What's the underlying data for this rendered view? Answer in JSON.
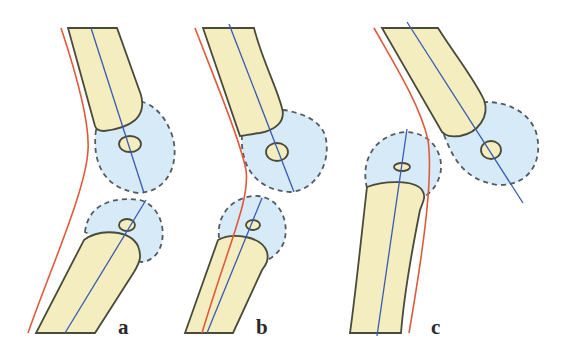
{
  "figure": {
    "colors": {
      "bone_fill": "#f3edc0",
      "bone_outline": "#4a4a3a",
      "capsule_fill": "#d6eaf7",
      "capsule_outline": "#555b60",
      "axis_line": "#3a5bb0",
      "contour_line": "#e05a3c",
      "background": "#ffffff"
    },
    "panels": [
      {
        "id": "a",
        "label": "a"
      },
      {
        "id": "b",
        "label": "b"
      },
      {
        "id": "c",
        "label": "c"
      }
    ]
  }
}
